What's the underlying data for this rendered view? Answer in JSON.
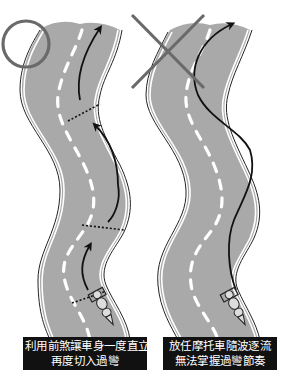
{
  "colors": {
    "road_fill": "#a9a9a9",
    "road_edge": "#222222",
    "lane_marking": "#ffffff",
    "path_line": "#111111",
    "symbol_gray": "#6a6a6a",
    "caption_bg": "#111111",
    "caption_text": "#ffffff",
    "background": "#ffffff"
  },
  "left_panel": {
    "symbol": "circle-correct",
    "caption": {
      "line1": "利用前煞讓車身一度直立",
      "line2": "再度切入過彎"
    }
  },
  "right_panel": {
    "symbol": "cross-incorrect",
    "caption": {
      "line1": "放任摩托車隨波逐流",
      "line2": "無法掌握過彎節奏"
    }
  }
}
